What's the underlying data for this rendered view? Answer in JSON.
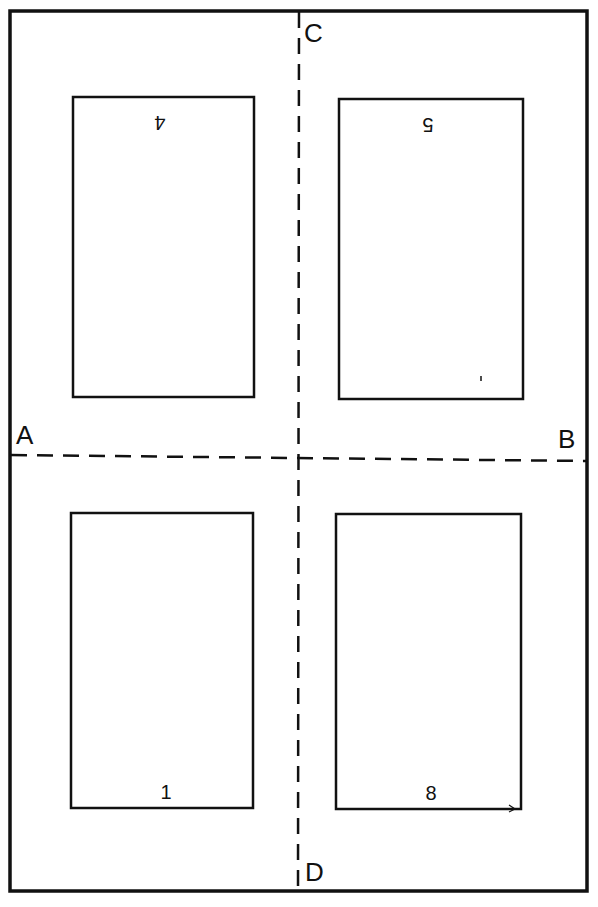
{
  "diagram": {
    "fold_labels": {
      "left": "A",
      "right": "B",
      "top": "C",
      "bottom": "D"
    },
    "pages": [
      {
        "position": "top-left",
        "number": "4",
        "orientation": "upside-down"
      },
      {
        "position": "top-right",
        "number": "5",
        "orientation": "upside-down"
      },
      {
        "position": "bottom-left",
        "number": "1",
        "orientation": "upright"
      },
      {
        "position": "bottom-right",
        "number": "8",
        "orientation": "upright"
      }
    ],
    "colors": {
      "ink": "#111111",
      "paper": "#ffffff"
    }
  }
}
